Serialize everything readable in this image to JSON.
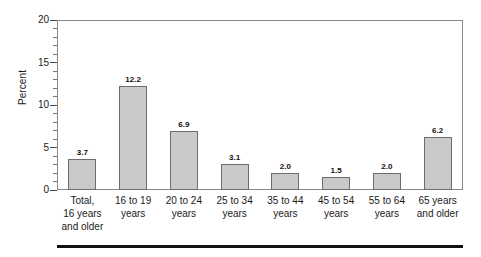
{
  "chart_data": {
    "type": "bar",
    "title": "",
    "xlabel": "",
    "ylabel": "Percent",
    "ylim": [
      0,
      20
    ],
    "yticks": [
      0,
      5,
      10,
      15,
      20
    ],
    "ytick_labels": [
      "0",
      "5",
      "10",
      "15",
      "20"
    ],
    "minor_tick_interval": 1,
    "grid": false,
    "legend": null,
    "categories": [
      "Total, 16 years and older",
      "16 to 19 years",
      "20 to 24 years",
      "25 to 34 years",
      "35 to 44 years",
      "45 to 54 years",
      "55 to 64 years",
      "65 years and older"
    ],
    "category_lines": [
      [
        "Total,",
        "16 years",
        "and older"
      ],
      [
        "16 to 19",
        "years"
      ],
      [
        "20 to 24",
        "years"
      ],
      [
        "25 to 34",
        "years"
      ],
      [
        "35 to 44",
        "years"
      ],
      [
        "45 to 54",
        "years"
      ],
      [
        "55 to 64",
        "years"
      ],
      [
        "65 years",
        "and older"
      ]
    ],
    "values": [
      3.7,
      12.2,
      6.9,
      3.1,
      2.0,
      1.5,
      2.0,
      6.2
    ],
    "value_labels": [
      "3.7",
      "12.2",
      "6.9",
      "3.1",
      "2.0",
      "1.5",
      "2.0",
      "6.2"
    ],
    "colors": {
      "bar_fill": "#c9c9c9",
      "bar_border": "#6d6d6d",
      "axis": "#8a8a8a",
      "text": "#1a1a1a",
      "rule": "#111111"
    }
  }
}
